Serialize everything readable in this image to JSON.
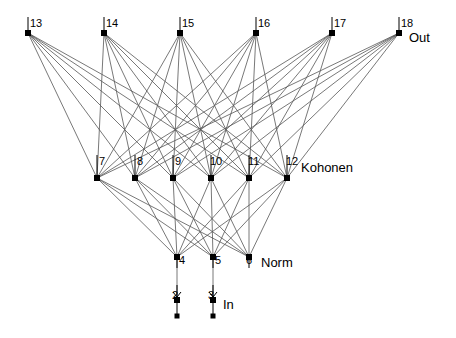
{
  "diagram": {
    "type": "neural-network-graph",
    "title": "",
    "background": "#ffffff",
    "node_color": "#000000",
    "edge_color": "#555555",
    "label_color": "#000000",
    "layer_labels": [
      {
        "id": "label-out",
        "text": "Out",
        "x": 409,
        "y": 42
      },
      {
        "id": "label-kohonen",
        "text": "Kohonen",
        "x": 301,
        "y": 172
      },
      {
        "id": "label-norm",
        "text": "Norm",
        "x": 261,
        "y": 267
      },
      {
        "id": "label-in",
        "text": "In",
        "x": 223,
        "y": 309
      }
    ],
    "nodes": [
      {
        "id": "2",
        "label": "2",
        "x": 177,
        "y": 300,
        "lx": 172,
        "ly": 299,
        "layer": "in"
      },
      {
        "id": "3",
        "label": "3",
        "x": 213,
        "y": 300,
        "lx": 208,
        "ly": 299,
        "layer": "in"
      },
      {
        "id": "4",
        "label": "4",
        "x": 177,
        "y": 257,
        "lx": 179,
        "ly": 264,
        "layer": "norm"
      },
      {
        "id": "5",
        "label": "5",
        "x": 213,
        "y": 257,
        "lx": 215,
        "ly": 264,
        "layer": "norm"
      },
      {
        "id": "6",
        "label": "6",
        "x": 249,
        "y": 257,
        "lx": 246,
        "ly": 264,
        "layer": "norm"
      },
      {
        "id": "7",
        "label": "7",
        "x": 97,
        "y": 178,
        "lx": 99,
        "ly": 165,
        "layer": "kohonen"
      },
      {
        "id": "8",
        "label": "8",
        "x": 135,
        "y": 178,
        "lx": 137,
        "ly": 165,
        "layer": "kohonen"
      },
      {
        "id": "9",
        "label": "9",
        "x": 173,
        "y": 178,
        "lx": 175,
        "ly": 165,
        "layer": "kohonen"
      },
      {
        "id": "10",
        "label": "10",
        "x": 211,
        "y": 178,
        "lx": 210,
        "ly": 165,
        "layer": "kohonen"
      },
      {
        "id": "11",
        "label": "11",
        "x": 249,
        "y": 178,
        "lx": 248,
        "ly": 165,
        "layer": "kohonen"
      },
      {
        "id": "12",
        "label": "12",
        "x": 287,
        "y": 178,
        "lx": 286,
        "ly": 165,
        "layer": "kohonen"
      },
      {
        "id": "13",
        "label": "13",
        "x": 28,
        "y": 33,
        "lx": 30,
        "ly": 27,
        "layer": "out"
      },
      {
        "id": "14",
        "label": "14",
        "x": 104,
        "y": 33,
        "lx": 106,
        "ly": 27,
        "layer": "out"
      },
      {
        "id": "15",
        "label": "15",
        "x": 180,
        "y": 33,
        "lx": 182,
        "ly": 27,
        "layer": "out"
      },
      {
        "id": "16",
        "label": "16",
        "x": 256,
        "y": 33,
        "lx": 258,
        "ly": 27,
        "layer": "out"
      },
      {
        "id": "17",
        "label": "17",
        "x": 332,
        "y": 33,
        "lx": 334,
        "ly": 27,
        "layer": "out"
      },
      {
        "id": "18",
        "label": "18",
        "x": 399,
        "y": 33,
        "lx": 401,
        "ly": 27,
        "layer": "out"
      }
    ],
    "node_ticks": [
      {
        "id": "tick-13",
        "x": 28,
        "y1": 17,
        "y2": 33
      },
      {
        "id": "tick-14",
        "x": 104,
        "y1": 17,
        "y2": 33
      },
      {
        "id": "tick-15",
        "x": 180,
        "y1": 17,
        "y2": 33
      },
      {
        "id": "tick-16",
        "x": 256,
        "y1": 17,
        "y2": 33
      },
      {
        "id": "tick-17",
        "x": 332,
        "y1": 17,
        "y2": 33
      },
      {
        "id": "tick-18",
        "x": 399,
        "y1": 17,
        "y2": 33
      },
      {
        "id": "tick-7",
        "x": 97,
        "y1": 155,
        "y2": 178
      },
      {
        "id": "tick-8",
        "x": 135,
        "y1": 155,
        "y2": 178
      },
      {
        "id": "tick-9",
        "x": 173,
        "y1": 155,
        "y2": 178
      },
      {
        "id": "tick-10",
        "x": 211,
        "y1": 155,
        "y2": 178
      },
      {
        "id": "tick-11",
        "x": 249,
        "y1": 155,
        "y2": 178
      },
      {
        "id": "tick-12",
        "x": 287,
        "y1": 155,
        "y2": 178
      },
      {
        "id": "tick-4",
        "x": 177,
        "y1": 257,
        "y2": 268
      },
      {
        "id": "tick-5",
        "x": 213,
        "y1": 257,
        "y2": 268
      },
      {
        "id": "tick-6",
        "x": 249,
        "y1": 257,
        "y2": 268
      }
    ],
    "input_stems": [
      {
        "id": "stem-2",
        "x": 177,
        "y1": 285,
        "y2": 316,
        "arrow_y": 297
      },
      {
        "id": "stem-3",
        "x": 213,
        "y1": 285,
        "y2": 316,
        "arrow_y": 297
      }
    ],
    "edges_in_to_norm": [
      {
        "from": "2",
        "to": "4"
      },
      {
        "from": "3",
        "to": "5"
      }
    ],
    "edges_norm_to_kohonen": [
      {
        "from": "4",
        "to": "7"
      },
      {
        "from": "4",
        "to": "8"
      },
      {
        "from": "4",
        "to": "9"
      },
      {
        "from": "4",
        "to": "10"
      },
      {
        "from": "4",
        "to": "11"
      },
      {
        "from": "4",
        "to": "12"
      },
      {
        "from": "5",
        "to": "7"
      },
      {
        "from": "5",
        "to": "8"
      },
      {
        "from": "5",
        "to": "9"
      },
      {
        "from": "5",
        "to": "10"
      },
      {
        "from": "5",
        "to": "11"
      },
      {
        "from": "5",
        "to": "12"
      },
      {
        "from": "6",
        "to": "7"
      },
      {
        "from": "6",
        "to": "8"
      },
      {
        "from": "6",
        "to": "9"
      },
      {
        "from": "6",
        "to": "10"
      },
      {
        "from": "6",
        "to": "11"
      },
      {
        "from": "6",
        "to": "12"
      }
    ],
    "edges_kohonen_to_out": [
      {
        "from": "7",
        "to": "13"
      },
      {
        "from": "7",
        "to": "14"
      },
      {
        "from": "7",
        "to": "15"
      },
      {
        "from": "7",
        "to": "16"
      },
      {
        "from": "7",
        "to": "17"
      },
      {
        "from": "7",
        "to": "18"
      },
      {
        "from": "8",
        "to": "13"
      },
      {
        "from": "8",
        "to": "14"
      },
      {
        "from": "8",
        "to": "15"
      },
      {
        "from": "8",
        "to": "16"
      },
      {
        "from": "8",
        "to": "17"
      },
      {
        "from": "8",
        "to": "18"
      },
      {
        "from": "9",
        "to": "13"
      },
      {
        "from": "9",
        "to": "14"
      },
      {
        "from": "9",
        "to": "15"
      },
      {
        "from": "9",
        "to": "16"
      },
      {
        "from": "9",
        "to": "17"
      },
      {
        "from": "9",
        "to": "18"
      },
      {
        "from": "10",
        "to": "13"
      },
      {
        "from": "10",
        "to": "14"
      },
      {
        "from": "10",
        "to": "15"
      },
      {
        "from": "10",
        "to": "16"
      },
      {
        "from": "10",
        "to": "17"
      },
      {
        "from": "10",
        "to": "18"
      },
      {
        "from": "11",
        "to": "13"
      },
      {
        "from": "11",
        "to": "14"
      },
      {
        "from": "11",
        "to": "15"
      },
      {
        "from": "11",
        "to": "16"
      },
      {
        "from": "11",
        "to": "17"
      },
      {
        "from": "11",
        "to": "18"
      },
      {
        "from": "12",
        "to": "13"
      },
      {
        "from": "12",
        "to": "14"
      },
      {
        "from": "12",
        "to": "15"
      },
      {
        "from": "12",
        "to": "16"
      },
      {
        "from": "12",
        "to": "17"
      },
      {
        "from": "12",
        "to": "18"
      }
    ]
  }
}
